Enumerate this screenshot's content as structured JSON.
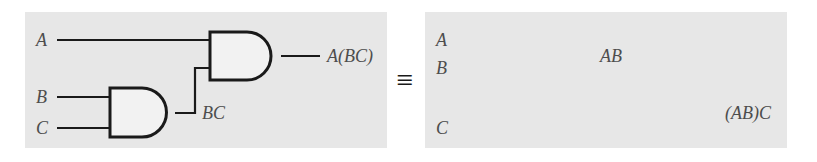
{
  "figure": {
    "relation_symbol": "≡",
    "panel_background": "#e7e7e7",
    "page_background": "#ffffff",
    "label_color": "#4d4d4d",
    "wire_color": "#1a1a1a"
  },
  "left_circuit": {
    "name": "A(BC)",
    "inputs": [
      {
        "label": "A",
        "x": 40,
        "y": 40
      },
      {
        "label": "B",
        "x": 40,
        "y": 97
      },
      {
        "label": "C",
        "x": 40,
        "y": 128
      }
    ],
    "gates": [
      {
        "id": "gate-bc",
        "type": "and",
        "inputs": [
          "B",
          "C"
        ],
        "output": "BC"
      },
      {
        "id": "gate-abc",
        "type": "and",
        "inputs": [
          "A",
          "BC"
        ],
        "output": "A(BC)"
      }
    ],
    "intermediate_label": "BC",
    "output_label": "A(BC)"
  },
  "right_circuit": {
    "name": "(AB)C",
    "inputs": [
      {
        "label": "A",
        "x": 440,
        "y": 40
      },
      {
        "label": "B",
        "x": 440,
        "y": 68
      },
      {
        "label": "C",
        "x": 440,
        "y": 128
      }
    ],
    "gates": [
      {
        "id": "gate-ab",
        "type": "and",
        "inputs": [
          "A",
          "B"
        ],
        "output": "AB"
      },
      {
        "id": "gate-abc2",
        "type": "and",
        "inputs": [
          "AB",
          "C"
        ],
        "output": "(AB)C"
      }
    ],
    "intermediate_label": "AB",
    "output_label_parts": {
      "open": "(",
      "inner": "AB",
      "close": ")",
      "tail": "C"
    },
    "output_label": "(AB)C"
  }
}
